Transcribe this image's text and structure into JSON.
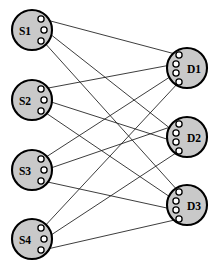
{
  "figure": {
    "type": "bipartite-graph",
    "width": 219,
    "height": 270,
    "background_color": "#ffffff"
  },
  "style": {
    "node_fill": "#c9c9c9",
    "node_stroke": "#000000",
    "node_stroke_width": 2.1,
    "node_radius": 20,
    "port_fill": "#ffffff",
    "port_stroke": "#000000",
    "port_radius": 3.1,
    "edge_color": "#1a1a1a",
    "edge_width": 0.85,
    "label_color": "#000000",
    "label_font_size": 11.5
  },
  "sources": [
    {
      "id": "S1",
      "label": "S1",
      "cx": 32,
      "cy": 30,
      "label_x": 25,
      "label_y": 31,
      "ports": [
        {
          "name": "S1-port-1",
          "x": 41,
          "y": 19
        },
        {
          "name": "S1-port-2",
          "x": 44,
          "y": 30
        },
        {
          "name": "S1-port-3",
          "x": 41,
          "y": 41
        }
      ]
    },
    {
      "id": "S2",
      "label": "S2",
      "cx": 32,
      "cy": 100,
      "label_x": 25,
      "label_y": 101,
      "ports": [
        {
          "name": "S2-port-1",
          "x": 41,
          "y": 89
        },
        {
          "name": "S2-port-2",
          "x": 44,
          "y": 100
        },
        {
          "name": "S2-port-3",
          "x": 41,
          "y": 111
        }
      ]
    },
    {
      "id": "S3",
      "label": "S3",
      "cx": 32,
      "cy": 170,
      "label_x": 25,
      "label_y": 171,
      "ports": [
        {
          "name": "S3-port-1",
          "x": 41,
          "y": 159
        },
        {
          "name": "S3-port-2",
          "x": 44,
          "y": 170
        },
        {
          "name": "S3-port-3",
          "x": 41,
          "y": 181
        }
      ]
    },
    {
      "id": "S4",
      "label": "S4",
      "cx": 32,
      "cy": 239,
      "label_x": 25,
      "label_y": 240,
      "ports": [
        {
          "name": "S4-port-1",
          "x": 41,
          "y": 228
        },
        {
          "name": "S4-port-2",
          "x": 44,
          "y": 239
        },
        {
          "name": "S4-port-3",
          "x": 41,
          "y": 250
        }
      ]
    }
  ],
  "destinations": [
    {
      "id": "D1",
      "label": "D1",
      "cx": 187,
      "cy": 68,
      "label_x": 194,
      "label_y": 69,
      "ports": [
        {
          "name": "D1-port-1",
          "x": 179,
          "y": 55
        },
        {
          "name": "D1-port-2",
          "x": 176,
          "y": 64
        },
        {
          "name": "D1-port-3",
          "x": 176,
          "y": 73
        },
        {
          "name": "D1-port-4",
          "x": 179,
          "y": 82
        }
      ]
    },
    {
      "id": "D2",
      "label": "D2",
      "cx": 187,
      "cy": 137,
      "label_x": 194,
      "label_y": 138,
      "ports": [
        {
          "name": "D2-port-1",
          "x": 179,
          "y": 124
        },
        {
          "name": "D2-port-2",
          "x": 176,
          "y": 133
        },
        {
          "name": "D2-port-3",
          "x": 176,
          "y": 142
        },
        {
          "name": "D2-port-4",
          "x": 179,
          "y": 151
        }
      ]
    },
    {
      "id": "D3",
      "label": "D3",
      "cx": 187,
      "cy": 205,
      "label_x": 194,
      "label_y": 206,
      "ports": [
        {
          "name": "D3-port-1",
          "x": 179,
          "y": 192
        },
        {
          "name": "D3-port-2",
          "x": 176,
          "y": 201
        },
        {
          "name": "D3-port-3",
          "x": 176,
          "y": 210
        },
        {
          "name": "D3-port-4",
          "x": 179,
          "y": 219
        }
      ]
    }
  ],
  "edges": [
    {
      "name": "edge-S1-D1",
      "from": "S1",
      "to": "D1",
      "x1": 43,
      "y1": 19,
      "x2": 179,
      "y2": 55
    },
    {
      "name": "edge-S1-D2",
      "from": "S1",
      "to": "D2",
      "x1": 45,
      "y1": 30,
      "x2": 176,
      "y2": 133
    },
    {
      "name": "edge-S1-D3",
      "from": "S1",
      "to": "D3",
      "x1": 43,
      "y1": 41,
      "x2": 179,
      "y2": 192
    },
    {
      "name": "edge-S2-D1",
      "from": "S2",
      "to": "D1",
      "x1": 43,
      "y1": 89,
      "x2": 176,
      "y2": 64
    },
    {
      "name": "edge-S2-D2",
      "from": "S2",
      "to": "D2",
      "x1": 45,
      "y1": 100,
      "x2": 176,
      "y2": 142
    },
    {
      "name": "edge-S2-D3",
      "from": "S2",
      "to": "D3",
      "x1": 43,
      "y1": 111,
      "x2": 176,
      "y2": 201
    },
    {
      "name": "edge-S3-D1",
      "from": "S3",
      "to": "D1",
      "x1": 43,
      "y1": 159,
      "x2": 176,
      "y2": 73
    },
    {
      "name": "edge-S3-D2",
      "from": "S3",
      "to": "D2",
      "x1": 45,
      "y1": 170,
      "x2": 179,
      "y2": 124
    },
    {
      "name": "edge-S3-D3",
      "from": "S3",
      "to": "D3",
      "x1": 43,
      "y1": 181,
      "x2": 176,
      "y2": 210
    },
    {
      "name": "edge-S4-D1",
      "from": "S4",
      "to": "D1",
      "x1": 43,
      "y1": 228,
      "x2": 179,
      "y2": 82
    },
    {
      "name": "edge-S4-D2",
      "from": "S4",
      "to": "D2",
      "x1": 45,
      "y1": 239,
      "x2": 179,
      "y2": 151
    },
    {
      "name": "edge-S4-D3",
      "from": "S4",
      "to": "D3",
      "x1": 43,
      "y1": 250,
      "x2": 179,
      "y2": 219
    }
  ]
}
